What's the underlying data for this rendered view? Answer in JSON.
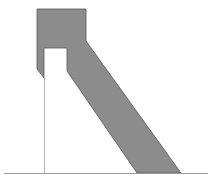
{
  "diagram": {
    "width": 222,
    "height": 184,
    "background": "#ffffff",
    "shapes": {
      "body": {
        "label": "gray-solid-shape",
        "fill": "#8c8c8c",
        "stroke": "#555555",
        "points": "37,9 86,9 86,41 181,173 137,173 67,71 67,48 44,48 44,78 37,69"
      },
      "ground_line": {
        "label": "baseline",
        "stroke": "#9a9a9a",
        "x1": 4,
        "y1": 173.5,
        "x2": 208,
        "y2": 173.5
      },
      "vertical_line": {
        "label": "vertical-support-line",
        "stroke": "#b5b5b5",
        "x1": 44.5,
        "y1": 78,
        "x2": 44.5,
        "y2": 173
      }
    }
  }
}
